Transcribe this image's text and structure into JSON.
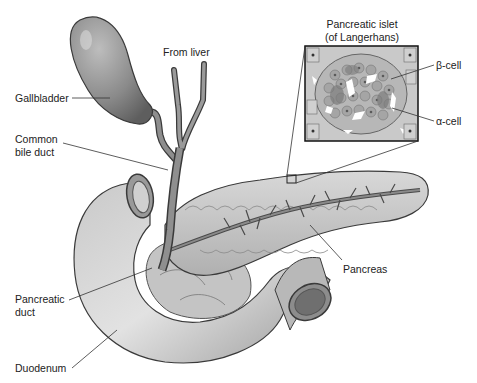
{
  "diagram": {
    "labels": {
      "from_liver": "From liver",
      "gallbladder": "Gallbladder",
      "common_bile_duct_1": "Common",
      "common_bile_duct_2": "bile duct",
      "pancreatic_duct_1": "Pancreatic",
      "pancreatic_duct_2": "duct",
      "duodenum": "Duodenum",
      "pancreas": "Pancreas",
      "islet_1": "Pancreatic islet",
      "islet_2": "(of Langerhans)",
      "beta_cell": "β-cell",
      "alpha_cell": "α-cell"
    },
    "colors": {
      "organ_fill": "#b5b5b5",
      "organ_dark": "#6e6e6e",
      "organ_light": "#dcdcdc",
      "outline": "#3a3a3a",
      "leader_line": "#333333",
      "background": "#ffffff"
    }
  }
}
